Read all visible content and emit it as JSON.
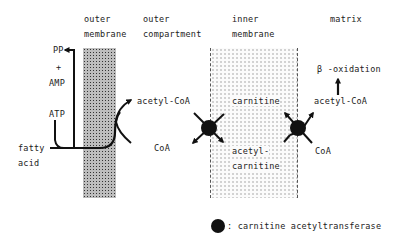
{
  "regions": {
    "outer_membrane": [
      "outer",
      "membrane"
    ],
    "outer_compartment": [
      "outer",
      "compartment"
    ],
    "inner_membrane": [
      "inner",
      "membrane"
    ],
    "matrix": "matrix"
  },
  "left_side": {
    "pp": "PP",
    "plus": "+",
    "amp": "AMP",
    "atp": "ATP",
    "fatty_acid": [
      "fatty",
      "acid"
    ]
  },
  "outer_compartment_labels": {
    "acetyl_coa": "acetyl-CoA",
    "coa": "CoA"
  },
  "inner_membrane_labels": {
    "carnitine": "carnitine",
    "acetyl_carnitine": [
      "acetyl-",
      "carnitine"
    ]
  },
  "matrix_labels": {
    "beta_oxidation": "β -oxidation",
    "acetyl_coa": "acetyl-CoA",
    "coa": "CoA"
  },
  "legend": {
    "symbol": "black-circle",
    "label": ": carnitine acetyltransferase"
  },
  "colors": {
    "line": "#111111",
    "enzyme": "#111111",
    "outer_membrane_fill": "#bdbdbd",
    "inner_membrane_fill": "#fbfbfb"
  }
}
